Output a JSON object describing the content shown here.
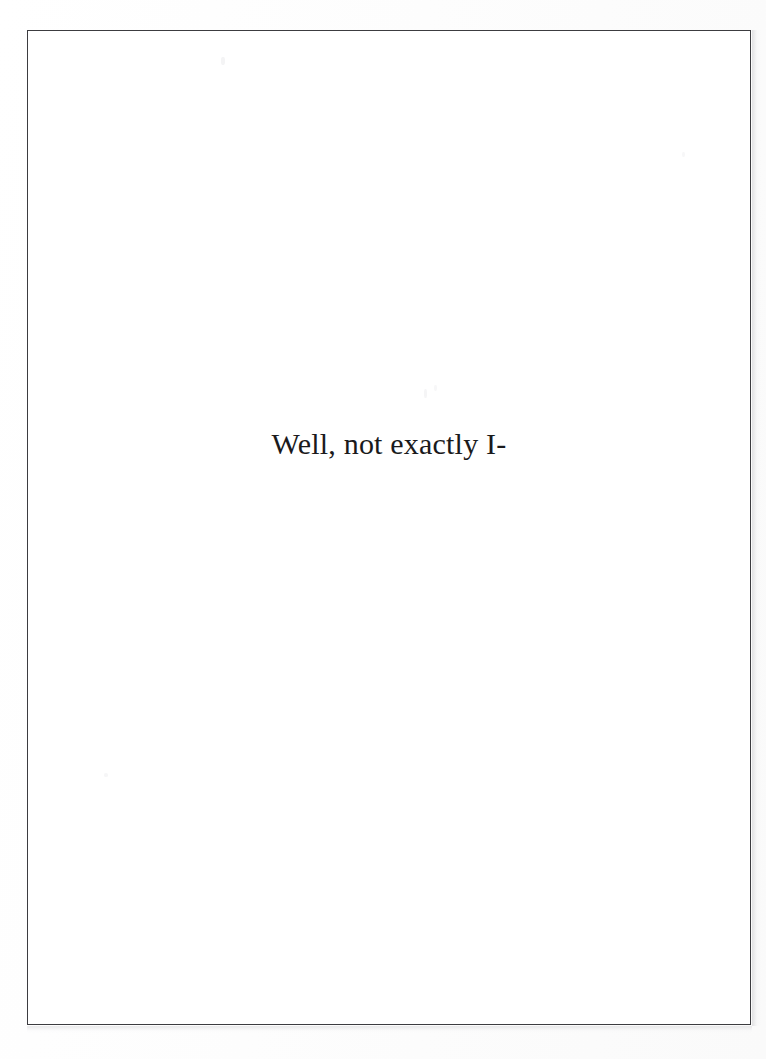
{
  "document": {
    "page_background_color": "#fcfcfc",
    "sheet_color": "#ffffff",
    "frame_border_color": "#3c3c40",
    "text_color": "#1a1a1c",
    "body": {
      "lines": [
        "Well, not exactly I-"
      ],
      "line_1": "Well, not exactly I-"
    }
  }
}
